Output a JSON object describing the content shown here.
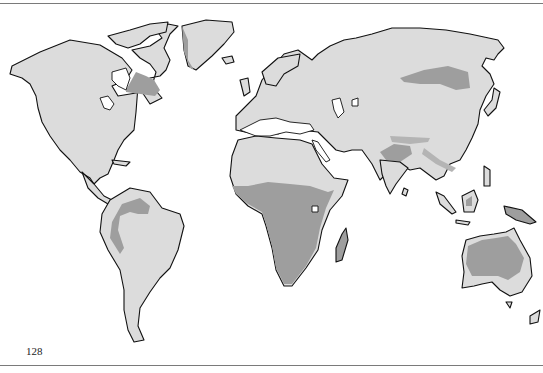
{
  "page": {
    "number": "128",
    "type": "scanned book page"
  },
  "map": {
    "title": "",
    "projection": "world",
    "colors": {
      "background": "#ffffff",
      "land_light": "#dcdcdc",
      "region_dark": "#9e9e9e",
      "region_mid": "#b4b4b4",
      "coastline": "#111111"
    },
    "shaded_regions": [
      {
        "name": "Hudson Bay / Quebec region",
        "shade": "dark"
      },
      {
        "name": "Greenland east coast",
        "shade": "dark"
      },
      {
        "name": "Amazon basin arc",
        "shade": "dark"
      },
      {
        "name": "Sub-Saharan Africa",
        "shade": "dark"
      },
      {
        "name": "Madagascar",
        "shade": "dark"
      },
      {
        "name": "Central Asia band",
        "shade": "dark"
      },
      {
        "name": "Himalaya / Indo-Gangetic band",
        "shade": "dark"
      },
      {
        "name": "Borneo interior",
        "shade": "dark"
      },
      {
        "name": "New Guinea",
        "shade": "dark"
      },
      {
        "name": "Australia interior",
        "shade": "dark"
      }
    ]
  }
}
